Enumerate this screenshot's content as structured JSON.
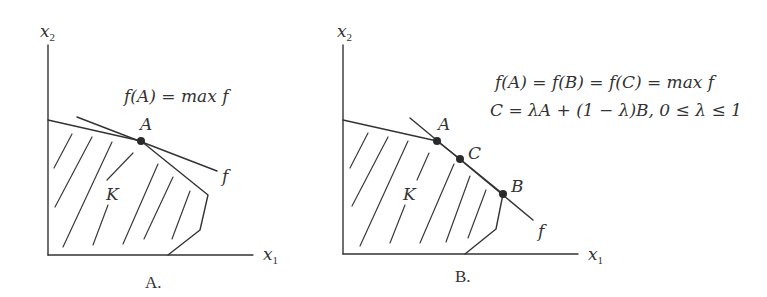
{
  "figure": {
    "panels": [
      {
        "id": "A",
        "caption": "A.",
        "axis_x_label": "x",
        "axis_x_sub": "1",
        "axis_y_label": "x",
        "axis_y_sub": "2",
        "region_label": "K",
        "objective_label": "f",
        "points": [
          {
            "label": "A"
          }
        ],
        "annotation": "f(A) = max f"
      },
      {
        "id": "B",
        "caption": "B.",
        "axis_x_label": "x",
        "axis_x_sub": "1",
        "axis_y_label": "x",
        "axis_y_sub": "2",
        "region_label": "K",
        "objective_label": "f",
        "points": [
          {
            "label": "A"
          },
          {
            "label": "C"
          },
          {
            "label": "B"
          }
        ],
        "annotation_line1": "f(A) = f(B) = f(C) = max f",
        "annotation_line2": "C = λA + (1 − λ)B, 0 ≤ λ ≤ 1"
      }
    ]
  }
}
